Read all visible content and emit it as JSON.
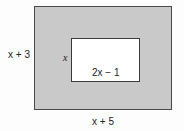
{
  "diagram": {
    "type": "nested-rectangles",
    "outer_rectangle": {
      "height_label": "x + 3",
      "width_label": "x + 5",
      "fill": "#c9c9c9"
    },
    "inner_rectangle": {
      "height_label": "x",
      "width_label": "2x − 1",
      "fill": "#ffffff"
    }
  }
}
